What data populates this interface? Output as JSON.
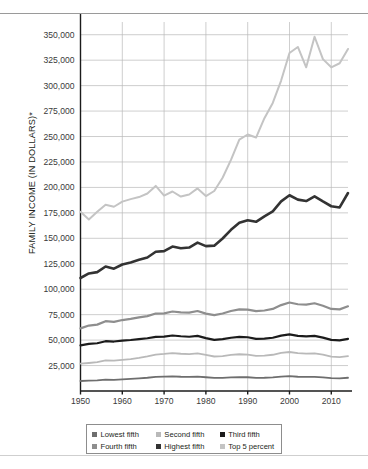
{
  "figure": {
    "ylabel": "FAMILY INCOME (IN DOLLARS)*"
  },
  "legend": {
    "row1": [
      {
        "label": "Lowest fifth",
        "color": "#6e6e6e"
      },
      {
        "label": "Second fifth",
        "color": "#b9b9b9"
      },
      {
        "label": "Third fifth",
        "color": "#1b1b1b"
      }
    ],
    "row2": [
      {
        "label": "Fourth fifth",
        "color": "#8e8e8e"
      },
      {
        "label": "Highest fifth",
        "color": "#333333"
      },
      {
        "label": "Top 5 percent",
        "color": "#c4c4c4"
      }
    ]
  },
  "chart_data": {
    "type": "line",
    "title": "",
    "xlabel": "",
    "ylabel": "FAMILY INCOME (IN DOLLARS)*",
    "xlim": [
      1950,
      2014
    ],
    "ylim": [
      0,
      362500
    ],
    "yticks": [
      25000,
      50000,
      75000,
      100000,
      125000,
      150000,
      175000,
      200000,
      225000,
      250000,
      275000,
      300000,
      325000,
      350000
    ],
    "ytick_labels": [
      "25,000",
      "50,000",
      "75,000",
      "100,000",
      "125,000",
      "150,000",
      "175,000",
      "200,000",
      "225,000",
      "250,000",
      "275,000",
      "300,000",
      "325,000",
      "350,000"
    ],
    "xticks": [
      1950,
      1960,
      1970,
      1980,
      1990,
      2000,
      2010
    ],
    "xtick_labels": [
      "1950",
      "1960",
      "1970",
      "1980",
      "1990",
      "2000",
      "2010"
    ],
    "grid": true,
    "legend_position": "bottom",
    "x": [
      1950,
      1952,
      1954,
      1956,
      1958,
      1960,
      1962,
      1964,
      1966,
      1968,
      1970,
      1972,
      1974,
      1976,
      1978,
      1980,
      1982,
      1984,
      1986,
      1988,
      1990,
      1992,
      1994,
      1996,
      1998,
      2000,
      2002,
      2004,
      2006,
      2008,
      2010,
      2012,
      2014
    ],
    "series": [
      {
        "name": "Lowest fifth",
        "color": "#6e6e6e",
        "width": 1.8,
        "values": [
          9800,
          10100,
          10400,
          11200,
          11000,
          11500,
          11900,
          12400,
          13000,
          13800,
          14100,
          14400,
          14000,
          13900,
          14100,
          13500,
          12800,
          12900,
          13300,
          13600,
          13500,
          12900,
          13000,
          13400,
          14200,
          14600,
          14000,
          13800,
          13900,
          13400,
          12600,
          12500,
          13000
        ]
      },
      {
        "name": "Second fifth",
        "color": "#b9b9b9",
        "width": 1.8,
        "values": [
          26800,
          27500,
          28300,
          30000,
          29800,
          30600,
          31400,
          32600,
          34000,
          35800,
          36400,
          37200,
          36600,
          36300,
          36900,
          35400,
          33900,
          34300,
          35400,
          36100,
          35800,
          34600,
          34800,
          35600,
          37400,
          38300,
          37200,
          36800,
          37000,
          35800,
          33800,
          33300,
          34200
        ]
      },
      {
        "name": "Third fifth",
        "color": "#1b1b1b",
        "width": 2.2,
        "values": [
          44800,
          46300,
          46900,
          48900,
          48600,
          49500,
          50100,
          51000,
          51800,
          53200,
          53400,
          54500,
          53800,
          53300,
          54200,
          52000,
          50300,
          50900,
          52300,
          53200,
          52800,
          51200,
          51400,
          52300,
          54400,
          55600,
          54200,
          53600,
          54100,
          52400,
          50200,
          49800,
          51200
        ]
      },
      {
        "name": "Fourth fifth",
        "color": "#8e8e8e",
        "width": 2.2,
        "values": [
          61500,
          64300,
          65200,
          68600,
          67900,
          69700,
          70800,
          72300,
          73600,
          76100,
          76300,
          78100,
          77300,
          77000,
          78600,
          76000,
          74600,
          76100,
          78600,
          80200,
          80000,
          78400,
          79100,
          80600,
          84400,
          86900,
          85200,
          84800,
          86200,
          83800,
          80600,
          80200,
          83200
        ]
      },
      {
        "name": "Highest fifth",
        "color": "#333333",
        "width": 2.6,
        "values": [
          111000,
          115500,
          116800,
          122300,
          120200,
          124300,
          126300,
          128900,
          131200,
          136800,
          137400,
          141900,
          140200,
          140900,
          145800,
          142300,
          142800,
          149800,
          158300,
          165200,
          167800,
          166200,
          171600,
          176500,
          186300,
          192300,
          188000,
          186600,
          191200,
          186200,
          181500,
          180300,
          194500
        ]
      },
      {
        "name": "Top 5 percent",
        "color": "#c4c4c4",
        "width": 2.0,
        "values": [
          176000,
          168500,
          176000,
          183000,
          181000,
          186000,
          188500,
          190500,
          194000,
          201500,
          192000,
          196000,
          191000,
          193000,
          199000,
          191500,
          196500,
          209500,
          227000,
          247000,
          252000,
          249000,
          268000,
          283000,
          305000,
          332000,
          338000,
          318000,
          348000,
          326000,
          318000,
          322000,
          336000
        ]
      }
    ]
  }
}
